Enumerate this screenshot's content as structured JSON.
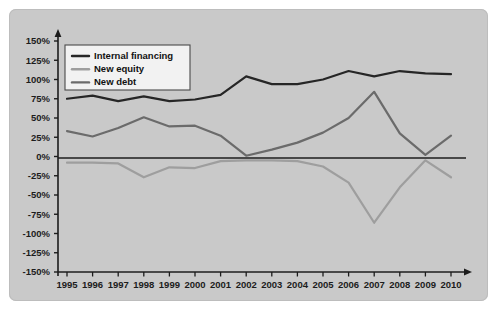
{
  "chart_data": {
    "type": "line",
    "title": "",
    "subtitle": "",
    "xlabel": "",
    "ylabel": "",
    "categories": [
      "1995",
      "1996",
      "1997",
      "1998",
      "1999",
      "2000",
      "2001",
      "2002",
      "2003",
      "2004",
      "2005",
      "2006",
      "2007",
      "2008",
      "2009",
      "2010"
    ],
    "x": [
      1995,
      1996,
      1997,
      1998,
      1999,
      2000,
      2001,
      2002,
      2003,
      2004,
      2005,
      2006,
      2007,
      2008,
      2009,
      2010
    ],
    "ylim": [
      -150,
      150
    ],
    "ytick_values": [
      150,
      125,
      100,
      75,
      50,
      25,
      0,
      -25,
      -50,
      -75,
      -100,
      -125,
      -150
    ],
    "ytick_labels": [
      "150%",
      "125%",
      "100%",
      "75%",
      "50%",
      "25%",
      "0%",
      "-25%",
      "-50%",
      "-75%",
      "-100%",
      "-125%",
      "-150%"
    ],
    "grid": false,
    "legend_position": "top-left",
    "value_unit": "%",
    "series": [
      {
        "name": "Internal financing",
        "color": "#262626",
        "values": [
          75,
          79,
          72,
          78,
          72,
          74,
          80,
          104,
          94,
          94,
          100,
          111,
          104,
          111,
          108,
          107
        ]
      },
      {
        "name": "New equity",
        "color": "#9e9e9e",
        "values": [
          -8,
          -8,
          -9,
          -27,
          -14,
          -15,
          -6,
          -5,
          -5,
          -6,
          -13,
          -34,
          -86,
          -40,
          -5,
          -27
        ]
      },
      {
        "name": "New debt",
        "color": "#6b6b6b",
        "values": [
          33,
          26,
          37,
          51,
          39,
          40,
          27,
          1,
          9,
          18,
          31,
          50,
          84,
          30,
          2,
          27
        ]
      }
    ]
  },
  "legend": {
    "items": [
      {
        "label": "Internal financing",
        "color": "#262626"
      },
      {
        "label": "New equity",
        "color": "#9e9e9e"
      },
      {
        "label": "New debt",
        "color": "#6b6b6b"
      }
    ]
  },
  "axes": {
    "y_axis_name": "percentage-axis",
    "x_axis_name": "year-axis",
    "zero_line_label": "0%"
  },
  "colors": {
    "panel_background": "#c9c9c9",
    "figure_background": "#ffffff",
    "axis": "#1c1c1c",
    "internal_financing": "#262626",
    "new_equity": "#9e9e9e",
    "new_debt": "#6b6b6b",
    "legend_box": "#f2f2f2"
  }
}
